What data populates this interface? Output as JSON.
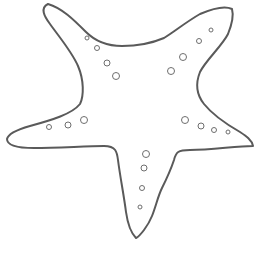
{
  "image": {
    "subject": "starfish outline",
    "width": 255,
    "height": 253,
    "background_color": "#ffffff",
    "outline_color": "#5a5a5a",
    "outline_width": 2,
    "dot_color": "#6e6e6e",
    "dot_stroke_width": 1
  },
  "starfish": {
    "outline_path": "M48,4 C40,8 44,16 50,24 C60,38 72,52 78,66 C84,80 84,96 80,104 C72,114 52,120 30,126 C16,130 8,134 7,139 C7,146 18,148 34,148 C58,148 86,146 104,146 C116,146 117,152 118,160 C120,176 124,196 126,212 C128,226 132,234 136,238 C140,236 148,226 152,216 C156,206 158,196 162,188 C166,180 170,172 174,160 C176,152 178,150 190,150 C212,150 236,146 253,146 C252,140 246,136 240,132 C226,124 212,114 204,104 C196,94 196,82 200,72 C206,60 222,46 228,34 C232,24 234,16 232,9 C226,6 214,8 200,14 C186,22 174,32 164,38 C150,44 136,46 122,46 C108,46 96,42 86,32 C74,20 62,8 48,4 Z",
    "dots": [
      {
        "arm": "top-left",
        "cx": 87,
        "cy": 38,
        "r": 2
      },
      {
        "arm": "top-left",
        "cx": 97,
        "cy": 48,
        "r": 2.5
      },
      {
        "arm": "top-left",
        "cx": 107,
        "cy": 63,
        "r": 3
      },
      {
        "arm": "top-left",
        "cx": 116,
        "cy": 76,
        "r": 3.5
      },
      {
        "arm": "top-right",
        "cx": 211,
        "cy": 30,
        "r": 2
      },
      {
        "arm": "top-right",
        "cx": 199,
        "cy": 41,
        "r": 2.5
      },
      {
        "arm": "top-right",
        "cx": 183,
        "cy": 57,
        "r": 3.5
      },
      {
        "arm": "top-right",
        "cx": 171,
        "cy": 71,
        "r": 3.5
      },
      {
        "arm": "left",
        "cx": 49,
        "cy": 127,
        "r": 2.5
      },
      {
        "arm": "left",
        "cx": 68,
        "cy": 125,
        "r": 3
      },
      {
        "arm": "left",
        "cx": 84,
        "cy": 120,
        "r": 3.5
      },
      {
        "arm": "right",
        "cx": 185,
        "cy": 120,
        "r": 3.5
      },
      {
        "arm": "right",
        "cx": 201,
        "cy": 126,
        "r": 3
      },
      {
        "arm": "right",
        "cx": 214,
        "cy": 130,
        "r": 2.5
      },
      {
        "arm": "right",
        "cx": 228,
        "cy": 132,
        "r": 2
      },
      {
        "arm": "bottom",
        "cx": 146,
        "cy": 154,
        "r": 3.5
      },
      {
        "arm": "bottom",
        "cx": 144,
        "cy": 168,
        "r": 3
      },
      {
        "arm": "bottom",
        "cx": 142,
        "cy": 188,
        "r": 2.5
      },
      {
        "arm": "bottom",
        "cx": 140,
        "cy": 207,
        "r": 2
      }
    ]
  }
}
